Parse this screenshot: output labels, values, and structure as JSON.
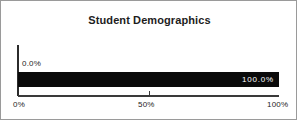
{
  "chart_data": {
    "type": "bar",
    "orientation": "horizontal",
    "title": "Student Demographics",
    "xlabel": "",
    "ylabel": "",
    "categories": [
      ""
    ],
    "values": [
      100.0
    ],
    "data_labels": [
      "100.0%"
    ],
    "baseline_label": "0.0%",
    "xlim": [
      0,
      100
    ],
    "x_tick_labels": [
      "0%",
      "50%",
      "100%"
    ],
    "x_tick_values": [
      0,
      50,
      100
    ],
    "grid": false,
    "legend": false,
    "colors": {
      "bar": "#0a0a0a",
      "bar_label_text": "#ffffff",
      "axis": "#2b2b2b",
      "text": "#1d1d1d",
      "background": "#ffffff",
      "frame_border": "#9a9a9a"
    }
  }
}
